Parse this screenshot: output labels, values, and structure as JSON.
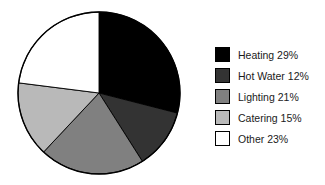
{
  "chart_data": {
    "type": "pie",
    "title": "",
    "subtitle": "",
    "xlabel": "",
    "ylabel": "",
    "grid": false,
    "legend_position": "right",
    "start_angle_deg": 0,
    "direction": "clockwise",
    "center": {
      "cx": 99,
      "cy": 93,
      "r": 81
    },
    "categories": [
      "Heating",
      "Hot Water",
      "Lighting",
      "Catering",
      "Other"
    ],
    "values": [
      29,
      12,
      21,
      15,
      23
    ],
    "units": "%",
    "colors": [
      "#000000",
      "#333333",
      "#808080",
      "#b9b9b9",
      "#ffffff"
    ],
    "slice_border_color": "#000000",
    "slices": [
      {
        "label": "Heating",
        "value": 29,
        "display": "Heating 29%",
        "color": "#000000"
      },
      {
        "label": "Hot Water",
        "value": 12,
        "display": "Hot Water 12%",
        "color": "#333333"
      },
      {
        "label": "Lighting",
        "value": 21,
        "display": "Lighting 21%",
        "color": "#808080"
      },
      {
        "label": "Catering",
        "value": 15,
        "display": "Catering 15%",
        "color": "#b9b9b9"
      },
      {
        "label": "Other",
        "value": 23,
        "display": "Other 23%",
        "color": "#ffffff"
      }
    ]
  },
  "legend": {
    "items": [
      {
        "label": "Heating 29%",
        "color": "#000000"
      },
      {
        "label": "Hot Water 12%",
        "color": "#333333"
      },
      {
        "label": "Lighting 21%",
        "color": "#808080"
      },
      {
        "label": "Catering 15%",
        "color": "#b9b9b9"
      },
      {
        "label": "Other 23%",
        "color": "#ffffff"
      }
    ]
  },
  "background_color": "#ffffff"
}
